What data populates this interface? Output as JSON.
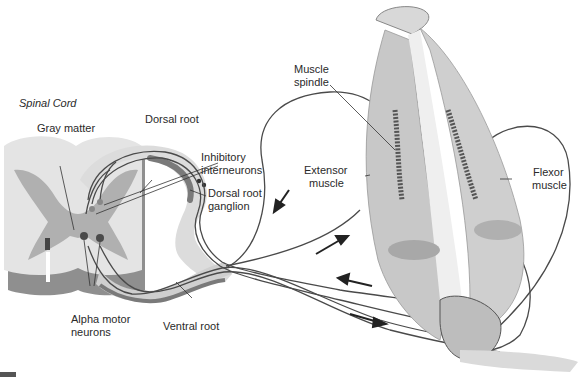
{
  "diagram": {
    "title": "Spinal Cord",
    "labels": {
      "gray_matter": "Gray matter",
      "dorsal_root": "Dorsal root",
      "inhibitory_interneurons_line1": "Inhibitory",
      "inhibitory_interneurons_line2": "interneurons",
      "dorsal_root_ganglion_line1": "Dorsal root",
      "dorsal_root_ganglion_line2": "ganglion",
      "alpha_motor_neurons_line1": "Alpha motor",
      "alpha_motor_neurons_line2": "neurons",
      "ventral_root": "Ventral root",
      "muscle_spindle_line1": "Muscle",
      "muscle_spindle_line2": "spindle",
      "extensor_muscle_line1": "Extensor",
      "extensor_muscle_line2": "muscle",
      "flexor_muscle_line1": "Flexor",
      "flexor_muscle_line2": "muscle"
    },
    "colors": {
      "white_matter": "#e6e6e6",
      "gray_matter": "#b5b5b5",
      "shadow": "#8a8a8a",
      "nerve_line": "#4a4a4a",
      "muscle": "#c9c9c9",
      "bone": "#eeeeee"
    }
  }
}
